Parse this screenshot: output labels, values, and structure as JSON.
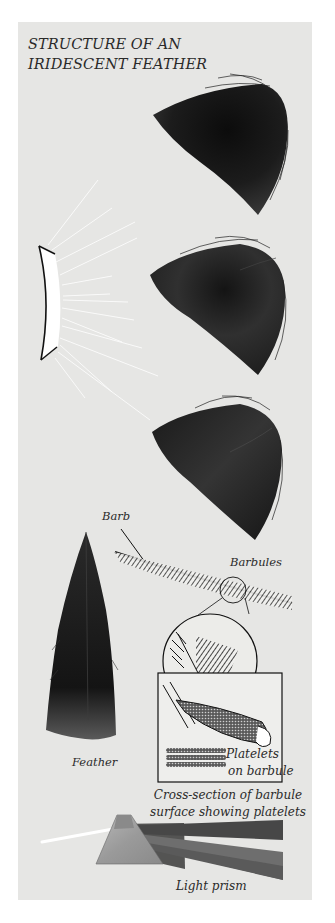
{
  "title": {
    "line1": "STRUCTURE OF AN",
    "line2": "IRIDESCENT FEATHER"
  },
  "labels": {
    "barb": "Barb",
    "barbules": "Barbules",
    "feather": "Feather",
    "platelets_line1": "Platelets",
    "platelets_line2": "on barbule",
    "cross_section_line1": "Cross-section of barbule",
    "cross_section_line2": "surface showing platelets",
    "light_prism": "Light prism"
  },
  "elements": {
    "light_source": "curved-mirror-light-source",
    "feather_views": 3,
    "magnifier": "barbule-magnified-circle",
    "prism": "light-prism"
  },
  "colors": {
    "panel": "#e6e6e4",
    "ink": "#1a1a1a",
    "feather_dark": "#151515",
    "feather_mid": "#2e2e2e",
    "rays": "#ffffff"
  }
}
